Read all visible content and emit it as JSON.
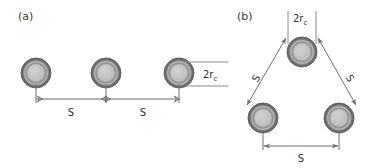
{
  "figure": {
    "width": 383,
    "height": 168,
    "background": "#ffffff",
    "panels": [
      {
        "id": "a",
        "label": "(a)",
        "label_x": 18,
        "label_y": 20,
        "arrangement": "linear",
        "circles": [
          {
            "cx": 36,
            "cy": 73
          },
          {
            "cx": 106,
            "cy": 73
          },
          {
            "cx": 179,
            "cy": 73
          }
        ],
        "dimensions": [
          {
            "name": "spacing-left",
            "label": "S",
            "label_x": 71,
            "label_y": 116,
            "x1": 36,
            "x2": 106,
            "y": 99
          },
          {
            "name": "spacing-right",
            "label": "S",
            "label_x": 143,
            "label_y": 116,
            "x1": 106,
            "x2": 179,
            "y": 99
          }
        ],
        "diameter_callout": {
          "label_main": "2r",
          "label_sub": "c",
          "label_x": 206,
          "label_y": 79,
          "lead_top_y": 62,
          "lead_bottom_y": 86,
          "lead_x1": 186,
          "lead_x2": 228
        }
      },
      {
        "id": "b",
        "label": "(b)",
        "label_x": 237,
        "label_y": 20,
        "arrangement": "triangular",
        "circles": [
          {
            "cx": 302,
            "cy": 52
          },
          {
            "cx": 263,
            "cy": 118
          },
          {
            "cx": 339,
            "cy": 118
          }
        ],
        "dimensions": [
          {
            "name": "spacing-left-diagonal",
            "label": "S",
            "label_x": 261,
            "label_y": 80,
            "rotation": -62
          },
          {
            "name": "spacing-right-diagonal",
            "label": "S",
            "label_x": 347,
            "label_y": 80,
            "rotation": 62
          },
          {
            "name": "spacing-bottom",
            "label": "S",
            "label_x": 301,
            "label_y": 161,
            "x1": 263,
            "x2": 339,
            "y": 146
          }
        ],
        "diameter_callout": {
          "label_main": "2r",
          "label_sub": "c",
          "label_x": 293,
          "label_y": 22,
          "lead_left_x": 288,
          "lead_right_x": 316,
          "lead_y1": 10,
          "lead_y2": 40
        }
      }
    ],
    "circle_style": {
      "outer_radius": 15,
      "ring_outer_color": "#6b6b6b",
      "ring_mid_color": "#b8b8b8",
      "ring_inner_color": "#8d8d8d",
      "core_color": "#bdbdbd",
      "outline_color": "#555555"
    },
    "line_color": "#6f6f6f",
    "text_color": "#2e2e2e"
  }
}
